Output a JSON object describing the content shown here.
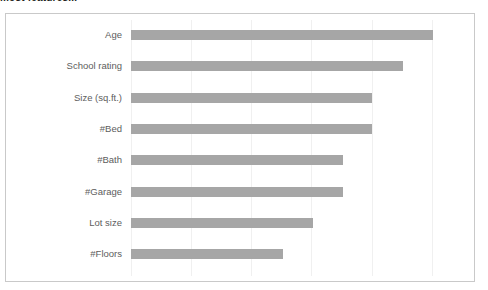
{
  "caption": {
    "text": "most features..."
  },
  "chart_frame": {
    "border_color": "#c9c9c9",
    "background": "#ffffff"
  },
  "chart_data": {
    "type": "bar",
    "orientation": "horizontal",
    "title": "",
    "subtitle": "",
    "xlabel": "",
    "ylabel": "",
    "categories": [
      "Age",
      "School rating",
      "Size (sq.ft.)",
      "#Bed",
      "#Bath",
      "#Garage",
      "Lot size",
      "#Floors"
    ],
    "values": [
      1.0,
      0.9,
      0.8,
      0.8,
      0.7,
      0.7,
      0.6,
      0.5
    ],
    "bar_pixel_ends": [
      432,
      402,
      371,
      371,
      342,
      342,
      312,
      282
    ],
    "axis_origin_px": 130,
    "xlim": [
      0,
      1.0
    ],
    "grid": true,
    "gridlines_px": [
      130,
      190,
      250,
      310,
      371,
      431
    ],
    "gridline_count": 6,
    "tick_labels": [],
    "legend": [],
    "legend_position": "none",
    "bar_color": "#a6a6a6",
    "label_color": "#5d5d5d",
    "gridline_color": "#f0f0f0"
  },
  "bars": [
    {
      "label": "Age",
      "value": 1.0,
      "width_pct": 100.0
    },
    {
      "label": "School rating",
      "value": 0.9,
      "width_pct": 90.0
    },
    {
      "label": "Size (sq.ft.)",
      "value": 0.8,
      "width_pct": 80.0
    },
    {
      "label": "#Bed",
      "value": 0.8,
      "width_pct": 80.0
    },
    {
      "label": "#Bath",
      "value": 0.7,
      "width_pct": 70.0
    },
    {
      "label": "#Garage",
      "value": 0.7,
      "width_pct": 70.0
    },
    {
      "label": "Lot size",
      "value": 0.6,
      "width_pct": 60.0
    },
    {
      "label": "#Floors",
      "value": 0.5,
      "width_pct": 50.0
    }
  ]
}
